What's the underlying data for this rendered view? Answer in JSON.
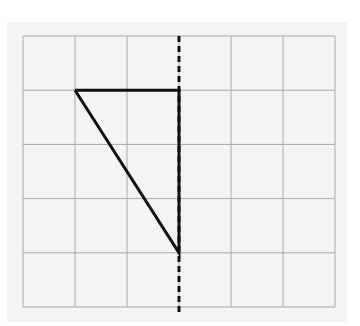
{
  "figure": {
    "type": "grid-diagram",
    "grid": {
      "columns": 6,
      "rows": 5,
      "origin_px": [
        23,
        36
      ],
      "cell_w_px": 52,
      "cell_h_px": 54.2,
      "line_color": "#a9a9a9",
      "background": "#f4f4f4"
    },
    "triangle": {
      "vertices_grid": [
        [
          1,
          1
        ],
        [
          3,
          1
        ],
        [
          3,
          4
        ]
      ],
      "stroke": "#111111",
      "stroke_width": 3
    },
    "symmetry_line": {
      "x_grid": 3,
      "style": "dashed",
      "color": "#111111",
      "from_y_px": 36,
      "to_y_px": 315
    }
  }
}
